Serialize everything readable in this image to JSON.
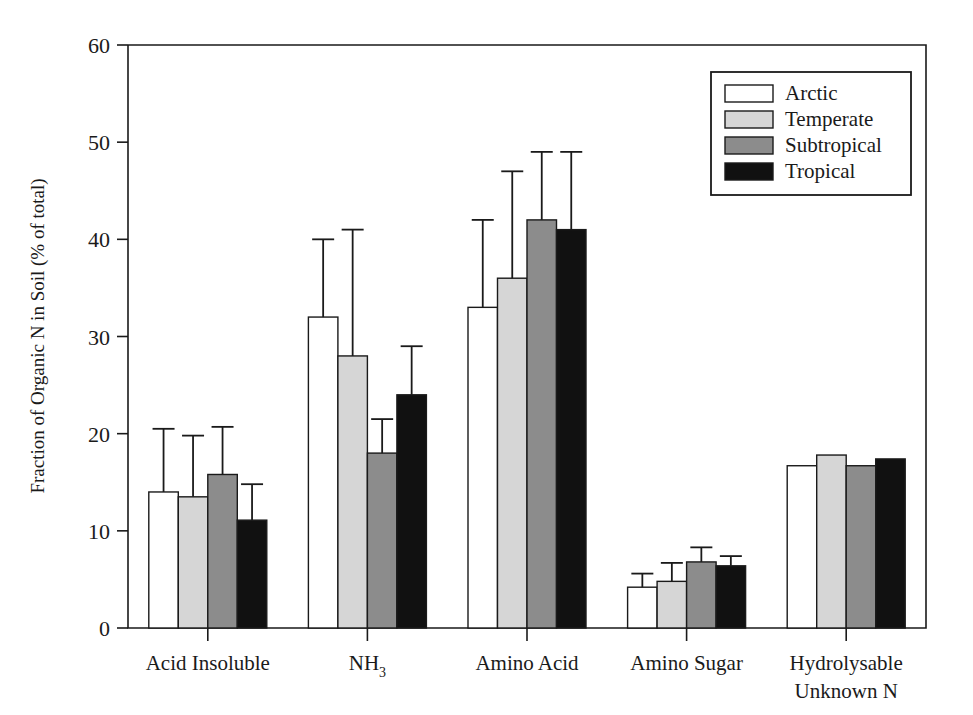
{
  "chart_data": {
    "type": "bar",
    "title": "",
    "subtitle": "",
    "xlabel": "",
    "ylabel": "Fraction of Organic N in Soil (% of total)",
    "ylim": [
      0,
      60
    ],
    "yticks": [
      0,
      10,
      20,
      30,
      40,
      50,
      60
    ],
    "ytick_labels": [
      "0",
      "10",
      "20",
      "30",
      "40",
      "50",
      "60"
    ],
    "grid": false,
    "legend_position": "top-right",
    "error_bars": "upper-only",
    "categories": [
      "Acid Insoluble",
      "NH3",
      "Amino Acid",
      "Amino Sugar",
      "Hydrolysable Unknown N"
    ],
    "category_labels": [
      {
        "line1": "Acid Insoluble",
        "line2": ""
      },
      {
        "line1": "NH",
        "sub": "3",
        "line2": ""
      },
      {
        "line1": "Amino Acid",
        "line2": ""
      },
      {
        "line1": "Amino Sugar",
        "line2": ""
      },
      {
        "line1": "Hydrolysable",
        "line2": "Unknown N"
      }
    ],
    "series": [
      {
        "name": "Arctic",
        "color": "#ffffff",
        "values": [
          14.0,
          32.0,
          33.0,
          4.2,
          16.7
        ],
        "err_upper": [
          6.5,
          8.0,
          9.0,
          1.4,
          0.0
        ]
      },
      {
        "name": "Temperate",
        "color": "#d6d6d6",
        "values": [
          13.5,
          28.0,
          36.0,
          4.8,
          17.8
        ],
        "err_upper": [
          6.3,
          13.0,
          11.0,
          1.9,
          0.0
        ]
      },
      {
        "name": "Subtropical",
        "color": "#8c8c8c",
        "values": [
          15.8,
          18.0,
          42.0,
          6.8,
          16.7
        ],
        "err_upper": [
          4.9,
          3.5,
          7.0,
          1.5,
          0.0
        ]
      },
      {
        "name": "Tropical",
        "color": "#111111",
        "values": [
          11.1,
          24.0,
          41.0,
          6.4,
          17.4
        ],
        "err_upper": [
          3.7,
          5.0,
          8.0,
          1.0,
          0.0
        ]
      }
    ]
  },
  "legend": {
    "entries": [
      "Arctic",
      "Temperate",
      "Subtropical",
      "Tropical"
    ]
  },
  "axis": {
    "y_title": "Fraction of Organic N in Soil (% of total)",
    "y_ticks": [
      "0",
      "10",
      "20",
      "30",
      "40",
      "50",
      "60"
    ]
  }
}
